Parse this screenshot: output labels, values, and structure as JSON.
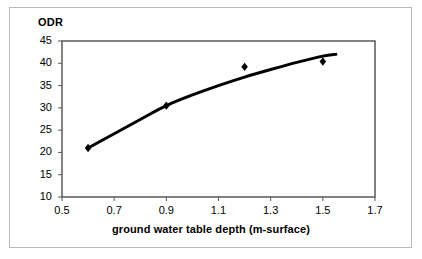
{
  "chart_data": {
    "type": "scatter",
    "title": "ODR",
    "xlabel": "ground water table depth (m-surface)",
    "ylabel": "ODR",
    "xlim": [
      0.5,
      1.7
    ],
    "ylim": [
      10,
      45
    ],
    "xticks": [
      "0.5",
      "0.7",
      "0.9",
      "1.1",
      "1.3",
      "1.5",
      "1.7"
    ],
    "xtick_values": [
      0.5,
      0.7,
      0.9,
      1.1,
      1.3,
      1.5,
      1.7
    ],
    "yticks": [
      "10",
      "15",
      "20",
      "25",
      "30",
      "35",
      "40",
      "45"
    ],
    "ytick_values": [
      10,
      15,
      20,
      25,
      30,
      35,
      40,
      45
    ],
    "grid": false,
    "legend": "none",
    "series": [
      {
        "name": "ODR measurements",
        "marker": "diamond",
        "color": "#000000",
        "x": [
          0.6,
          0.9,
          1.2,
          1.5
        ],
        "values": [
          21.0,
          30.5,
          39.2,
          40.4
        ]
      },
      {
        "name": "fitted trend",
        "marker": "none",
        "line": "solid",
        "color": "#000000",
        "x": [
          0.6,
          0.7,
          0.8,
          0.9,
          1.0,
          1.1,
          1.2,
          1.3,
          1.4,
          1.5,
          1.55
        ],
        "values": [
          21.0,
          24.2,
          27.4,
          30.5,
          32.9,
          35.0,
          36.9,
          38.6,
          40.2,
          41.6,
          42.0
        ]
      }
    ]
  },
  "axes": {
    "plot_left_px": 62,
    "plot_right_px": 375,
    "plot_top_px": 41,
    "plot_bottom_px": 197,
    "axis_color": "#595959",
    "axis_width_px": 1.5,
    "tick_length_px": 4
  },
  "frame": {
    "border_color": "#b9b9b9",
    "background": "#ffffff"
  }
}
